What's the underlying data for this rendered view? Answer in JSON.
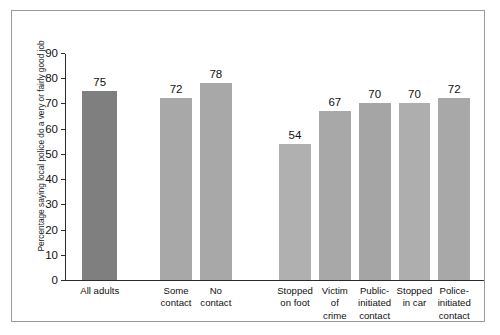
{
  "chart_data": {
    "type": "bar",
    "title": "",
    "xlabel": "",
    "ylabel": "Percentage saying local police do a very or fairly good job",
    "ylim": [
      0,
      90
    ],
    "ytick_labels": [
      "90",
      "80",
      "70",
      "60",
      "50",
      "40",
      "30",
      "20",
      "10",
      "0"
    ],
    "ytick_values": [
      90,
      80,
      70,
      60,
      50,
      40,
      30,
      20,
      10,
      0
    ],
    "grid": false,
    "legend": null,
    "categories": [
      "All adults",
      "Some\ncontact",
      "No\ncontact",
      "Stopped\non foot",
      "Victim\nof\ncrime",
      "Public-\ninitiated\ncontact",
      "Stopped\nin car",
      "Police-\ninitiated\ncontact"
    ],
    "values": [
      75,
      72,
      78,
      54,
      67,
      70,
      70,
      72
    ],
    "value_labels": [
      "75",
      "72",
      "78",
      "54",
      "67",
      "70",
      "70",
      "72"
    ],
    "bar_colors": [
      "#7f7f7f",
      "#a8a8a8",
      "#a8a8a8",
      "#b0b0b0",
      "#a8a8a8",
      "#a5a5a5",
      "#aeaeae",
      "#a8a8a8"
    ],
    "groups": [
      {
        "name": "overall",
        "category_indices": [
          0
        ]
      },
      {
        "name": "contact-summary",
        "category_indices": [
          1,
          2
        ]
      },
      {
        "name": "contact-detail",
        "category_indices": [
          3,
          4,
          5,
          6,
          7
        ]
      }
    ],
    "bar_geometry": [
      {
        "left_pct": 4.1,
        "width_pct": 8.4
      },
      {
        "left_pct": 22.7,
        "width_pct": 7.6
      },
      {
        "left_pct": 32.2,
        "width_pct": 7.6
      },
      {
        "left_pct": 51.1,
        "width_pct": 7.6
      },
      {
        "left_pct": 60.6,
        "width_pct": 7.6
      },
      {
        "left_pct": 70.1,
        "width_pct": 7.6
      },
      {
        "left_pct": 79.6,
        "width_pct": 7.6
      },
      {
        "left_pct": 89.1,
        "width_pct": 7.6
      }
    ]
  },
  "colors": {
    "axis": "#2b2b2b",
    "frame": "#9a9a9a",
    "text": "#111111",
    "highlight_bar": "#7f7f7f",
    "default_bar": "#a8a8a8",
    "background": "#ffffff"
  }
}
